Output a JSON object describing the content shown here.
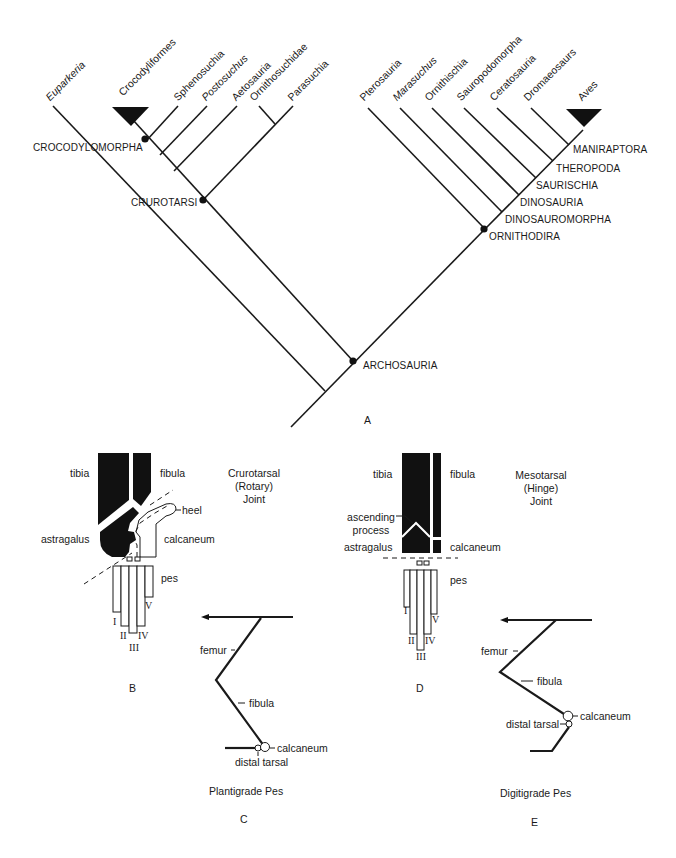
{
  "panel_a": {
    "letter": "A",
    "taxa": [
      {
        "name": "Euparkeria",
        "italic": true
      },
      {
        "name": "Crocodyliformes",
        "italic": false
      },
      {
        "name": "Sphenosuchia",
        "italic": false
      },
      {
        "name": "Postosuchus",
        "italic": true
      },
      {
        "name": "Aetosauria",
        "italic": false
      },
      {
        "name": "Ornithosuchidae",
        "italic": false
      },
      {
        "name": "Parasuchia",
        "italic": false
      },
      {
        "name": "Pterosauria",
        "italic": false
      },
      {
        "name": "Marasuchus",
        "italic": true
      },
      {
        "name": "Ornithischia",
        "italic": false
      },
      {
        "name": "Sauropodomorpha",
        "italic": false
      },
      {
        "name": "Ceratosauria",
        "italic": false
      },
      {
        "name": "Dromaeosaurs",
        "italic": false
      },
      {
        "name": "Aves",
        "italic": false
      }
    ],
    "clades": {
      "crocodylomorpha": "CROCODYLOMORPHA",
      "crurotarsi": "CRUROTARSI",
      "archosauria": "ARCHOSAURIA",
      "ornithodira": "ORNITHODIRA",
      "dinosauromorpha": "DINOSAUROMORPHA",
      "dinosauria": "DINOSAURIA",
      "saurischia": "SAURISCHIA",
      "theropoda": "THEROPODA",
      "maniraptora": "MANIRAPTORA"
    }
  },
  "panel_b": {
    "letter": "B",
    "title_lines": [
      "Crurotarsal",
      "(Rotary)",
      "Joint"
    ],
    "labels": {
      "tibia": "tibia",
      "fibula": "fibula",
      "heel": "heel",
      "astragalus": "astragalus",
      "calcaneum": "calcaneum",
      "pes": "pes"
    },
    "digits": [
      "I",
      "II",
      "III",
      "IV",
      "V"
    ]
  },
  "panel_c": {
    "letter": "C",
    "caption": "Plantigrade Pes",
    "labels": {
      "femur": "femur",
      "fibula": "fibula",
      "calcaneum": "calcaneum",
      "distal_tarsal": "distal tarsal"
    }
  },
  "panel_d": {
    "letter": "D",
    "title_lines": [
      "Mesotarsal",
      "(Hinge)",
      "Joint"
    ],
    "labels": {
      "tibia": "tibia",
      "fibula": "fibula",
      "ascending_process": [
        "ascending",
        "process"
      ],
      "astragalus": "astragalus",
      "calcaneum": "calcaneum",
      "pes": "pes"
    },
    "digits": [
      "I",
      "II",
      "III",
      "IV",
      "V"
    ]
  },
  "panel_e": {
    "letter": "E",
    "caption": "Digitigrade Pes",
    "labels": {
      "femur": "femur",
      "fibula": "fibula",
      "calcaneum": "calcaneum",
      "distal_tarsal": "distal tarsal"
    }
  }
}
